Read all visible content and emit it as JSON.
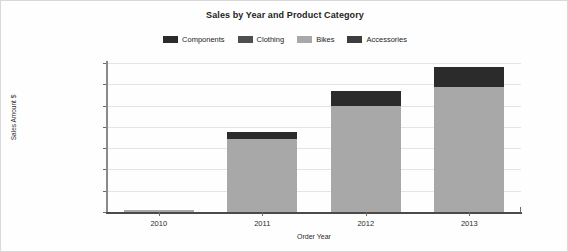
{
  "chart_data": {
    "type": "bar",
    "subtype": "stacked-column",
    "title": "Sales by Year and Product Category",
    "xlabel": "Order Year",
    "ylabel": "Sales Amount $",
    "categories": [
      "2010",
      "2011",
      "2012",
      "2013"
    ],
    "series": [
      {
        "name": "Components",
        "color": "#2b2b2b",
        "values": [
          0,
          1600000,
          3500000,
          4700000
        ]
      },
      {
        "name": "Clothing",
        "color": "#4f4f4f",
        "values": [
          0,
          0,
          0,
          0
        ]
      },
      {
        "name": "Bikes",
        "color": "#a8a8a8",
        "values": [
          400000,
          17200000,
          24900000,
          29400000
        ]
      },
      {
        "name": "Accessories",
        "color": "#3d3d3d",
        "values": [
          0,
          0,
          0,
          0
        ]
      }
    ],
    "totals": [
      400000,
      18800000,
      28400000,
      34100000
    ],
    "ylim": [
      0,
      35000000
    ],
    "ytick_values": [
      0,
      5000000,
      10000000,
      15000000,
      20000000,
      25000000,
      30000000,
      35000000
    ],
    "ytick_labels": [
      "$0",
      "$5,000,000",
      "$10,000,000",
      "$15,000,000",
      "$20,000,000",
      "$25,000,000",
      "$30,000,000",
      "$35,000,000"
    ],
    "grid": true,
    "legend_position": "top"
  },
  "legend": {
    "items": [
      {
        "label": "Components",
        "color": "#2b2b2b"
      },
      {
        "label": "Clothing",
        "color": "#4f4f4f"
      },
      {
        "label": "Bikes",
        "color": "#a8a8a8"
      },
      {
        "label": "Accessories",
        "color": "#3d3d3d"
      }
    ]
  }
}
